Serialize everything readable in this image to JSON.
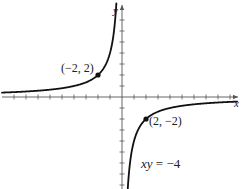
{
  "chart_data": {
    "type": "line",
    "title": "",
    "xlabel": "x",
    "ylabel": "y",
    "xlim": [
      -10,
      10
    ],
    "ylim": [
      -8,
      8.5
    ],
    "grid": false,
    "legend": null,
    "series": [
      {
        "name": "xy = -4",
        "equation": "y = -4/x",
        "branches": [
          {
            "x": [
              -10,
              -8,
              -6,
              -4,
              -3,
              -2,
              -1.5,
              -1,
              -0.6,
              -0.5
            ],
            "y": [
              0.4,
              0.5,
              0.667,
              1,
              1.333,
              2,
              2.667,
              4,
              6.667,
              8
            ]
          },
          {
            "x": [
              0.5,
              0.6,
              1,
              1.5,
              2,
              3,
              4,
              6,
              8,
              10
            ],
            "y": [
              -8,
              -6.667,
              -4,
              -2.667,
              -2,
              -1.333,
              -1,
              -0.667,
              -0.5,
              -0.4
            ]
          }
        ]
      }
    ],
    "points": [
      {
        "x": -2,
        "y": 2,
        "label": "(−2, 2)"
      },
      {
        "x": 2,
        "y": -2,
        "label": "(2, −2)"
      }
    ],
    "annotations": [
      {
        "text": "xy = −4",
        "x": 3,
        "y": -6.5
      }
    ],
    "tick_spacing": 1
  },
  "labels": {
    "x_axis": "x",
    "y_axis": "y",
    "point_a": "(−2, 2)",
    "point_b": "(2, −2)",
    "eq_xy": "xy",
    "eq_rest": " = −4"
  },
  "colors": {
    "curve": "#111111",
    "axis": "#555555",
    "text": "#222222"
  }
}
